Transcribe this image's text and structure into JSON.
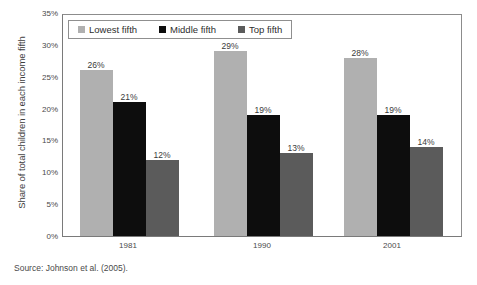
{
  "chart_data": {
    "type": "bar",
    "title": "",
    "subtitle": "",
    "xlabel": "",
    "ylabel": "Share of total children in each income fifth",
    "categories": [
      "1981",
      "1990",
      "2001"
    ],
    "series": [
      {
        "name": "Lowest fifth",
        "color": "#b0b0b0",
        "values": [
          26,
          29,
          28
        ],
        "labels": [
          "26%",
          "29%",
          "28%"
        ]
      },
      {
        "name": "Middle fifth",
        "color": "#0d0d0d",
        "values": [
          21,
          19,
          19
        ],
        "labels": [
          "21%",
          "19%",
          "19%"
        ]
      },
      {
        "name": "Top fifth",
        "color": "#5b5b5b",
        "values": [
          12,
          13,
          14
        ],
        "labels": [
          "12%",
          "13%",
          "14%"
        ]
      }
    ],
    "ylim": [
      0,
      35
    ],
    "y_ticks": [
      0,
      5,
      10,
      15,
      20,
      25,
      30,
      35
    ],
    "y_tick_labels": [
      "0%",
      "5%",
      "10%",
      "15%",
      "20%",
      "25%",
      "30%",
      "35%"
    ],
    "grid": false,
    "legend_position": "top-left",
    "value_labels_shown": true
  },
  "legend": {
    "items": [
      {
        "label": "Lowest fifth",
        "color": "#b0b0b0"
      },
      {
        "label": "Middle fifth",
        "color": "#0d0d0d"
      },
      {
        "label": "Top fifth",
        "color": "#5b5b5b"
      }
    ]
  },
  "source": {
    "text": "Source: Johnson et al. (2005)."
  }
}
